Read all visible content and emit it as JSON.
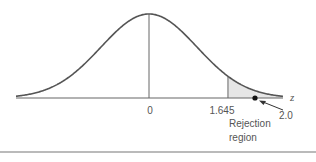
{
  "figure": {
    "type": "normal-distribution-diagram",
    "axis_label": "z",
    "colors": {
      "curve": "#555555",
      "axis": "#666666",
      "rejection_fill": "#e6e6e6",
      "point": "#111111",
      "text": "#555555",
      "rule": "#777777"
    },
    "ticks": [
      {
        "value": 0,
        "label": "0"
      },
      {
        "value": 1.645,
        "label": "1.645"
      }
    ],
    "critical_value": 1.645,
    "test_statistic": {
      "value": 2.0,
      "label": "2.0"
    },
    "rejection_region": {
      "from": 1.645,
      "direction": "upper-tail",
      "label_line1": "Rejection",
      "label_line2": "region"
    }
  }
}
